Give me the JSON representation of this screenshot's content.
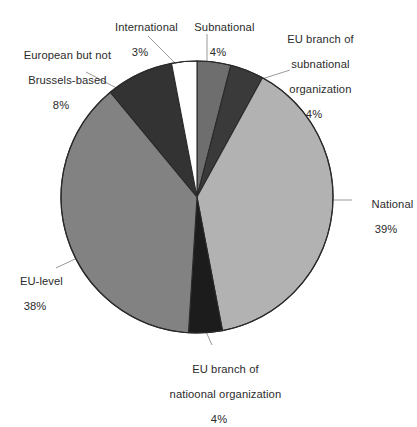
{
  "chart_data": {
    "type": "pie",
    "title": "",
    "subtitle": "",
    "xlabel": "",
    "ylabel": "",
    "legend_position": "none",
    "grid": false,
    "labels_outside": true,
    "start_angle_deg": 0,
    "direction": "clockwise",
    "categories": [
      "Subnational",
      "EU branch of subnational organization",
      "National",
      "EU branch of natioonal organization",
      "EU-level",
      "European but not Brussels-based",
      "International"
    ],
    "values": [
      4,
      4,
      39,
      4,
      38,
      8,
      3
    ],
    "value_suffix": "%",
    "slices": [
      {
        "name": "Subnational",
        "label_lines": [
          "Subnational"
        ],
        "value": 4,
        "value_text": "4%",
        "color": "#6e6e6e"
      },
      {
        "name": "EU branch of subnational organization",
        "label_lines": [
          "EU branch of",
          "subnational",
          "organization"
        ],
        "value": 4,
        "value_text": "4%",
        "color": "#3a3a3a"
      },
      {
        "name": "National",
        "label_lines": [
          "National"
        ],
        "value": 39,
        "value_text": "39%",
        "color": "#b2b2b2"
      },
      {
        "name": "EU branch of natioonal organization",
        "label_lines": [
          "EU branch of",
          "natioonal organization"
        ],
        "value": 4,
        "value_text": "4%",
        "color": "#1c1c1c"
      },
      {
        "name": "EU-level",
        "label_lines": [
          "EU-level"
        ],
        "value": 38,
        "value_text": "38%",
        "color": "#828282"
      },
      {
        "name": "European but not Brussels-based",
        "label_lines": [
          "European but not",
          "Brussels-based"
        ],
        "value": 8,
        "value_text": "8%",
        "color": "#333333"
      },
      {
        "name": "International",
        "label_lines": [
          "International"
        ],
        "value": 3,
        "value_text": "3%",
        "color": "#ffffff"
      }
    ]
  },
  "labels": {
    "international": {
      "line1": "International",
      "pct": "3%"
    },
    "subnational": {
      "line1": "Subnational",
      "pct": "4%"
    },
    "eu_branch_subnational": {
      "line1": "EU branch of",
      "line2": "subnational",
      "line3": "organization",
      "pct": "4%"
    },
    "european_not_brussels": {
      "line1": "European but not",
      "line2": "Brussels-based",
      "pct": "8%"
    },
    "national": {
      "line1": "National",
      "pct": "39%"
    },
    "eu_level": {
      "line1": "EU-level",
      "pct": "38%"
    },
    "eu_branch_national": {
      "line1": "EU branch of",
      "line2": "natioonal organization",
      "pct": "4%"
    }
  },
  "style": {
    "slice_outline": "#2a2a2a",
    "leader_line": "#8a8a8a",
    "background": "#ffffff",
    "text": "#2b2b2b"
  }
}
